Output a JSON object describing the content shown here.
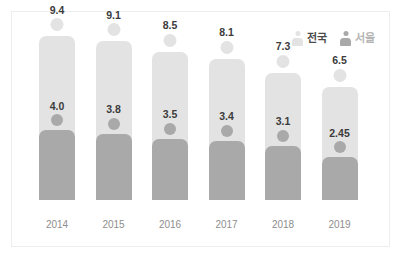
{
  "chart_data": {
    "type": "bar",
    "title": "",
    "subtitle": "",
    "xlabel": "",
    "ylabel": "",
    "categories": [
      "2014",
      "2015",
      "2016",
      "2017",
      "2018",
      "2019"
    ],
    "series": [
      {
        "name": "전국",
        "color": "#e3e3e3",
        "values": [
          9.4,
          9.1,
          8.5,
          8.1,
          7.3,
          6.5
        ],
        "value_labels": [
          "9.4",
          "9.1",
          "8.5",
          "8.1",
          "7.3",
          "6.5"
        ]
      },
      {
        "name": "서울",
        "color": "#a9a9a9",
        "values": [
          4.0,
          3.8,
          3.5,
          3.4,
          3.1,
          2.45
        ],
        "value_labels": [
          "4.0",
          "3.8",
          "3.5",
          "3.4",
          "3.1",
          "2.45"
        ]
      }
    ],
    "ylim": [
      0,
      9.4
    ],
    "grid": false,
    "legend_position": "top-right"
  },
  "legend": {
    "items": [
      {
        "label": "전국",
        "icon": "person-icon",
        "color": "#e3e3e3",
        "text_color": "#4a4a4a"
      },
      {
        "label": "서울",
        "icon": "person-icon",
        "color": "#a9a9a9",
        "text_color": "#b4b4b4"
      }
    ]
  },
  "colors": {
    "light_gray": "#e3e3e3",
    "dark_gray": "#a9a9a9",
    "value_text": "#3b3b3b",
    "axis_text": "#8e8e8e",
    "card_border": "#ededed",
    "background": "#ffffff"
  }
}
